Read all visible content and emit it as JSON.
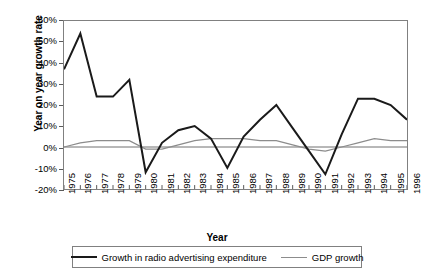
{
  "chart_data": {
    "type": "line",
    "title": "",
    "xlabel": "Year",
    "ylabel": "Year on year growth rate",
    "x": [
      1975,
      1976,
      1977,
      1978,
      1979,
      1980,
      1981,
      1982,
      1983,
      1984,
      1985,
      1986,
      1987,
      1988,
      1989,
      1990,
      1991,
      1992,
      1993,
      1994,
      1995,
      1996
    ],
    "categories": [
      "1975",
      "1976",
      "1977",
      "1978",
      "1979",
      "1980",
      "1981",
      "1982",
      "1983",
      "1984",
      "1985",
      "1986",
      "1987",
      "1988",
      "1989",
      "1990",
      "1991",
      "1992",
      "1993",
      "1994",
      "1995",
      "1996"
    ],
    "xlim": [
      1975,
      1996
    ],
    "ylim": [
      -20,
      60
    ],
    "ytick_values": [
      60,
      50,
      40,
      30,
      20,
      10,
      0,
      -10,
      -20
    ],
    "ytick_labels": [
      "60%",
      "50%",
      "40%",
      "30%",
      "20%",
      "10%",
      "0%",
      "-10%",
      "-20%"
    ],
    "grid": false,
    "legend_position": "bottom",
    "series": [
      {
        "name": "Growth in radio advertising expenditure",
        "color": "#1a1a1a",
        "width": 2,
        "values": [
          37,
          54,
          24,
          24,
          32,
          -12,
          2,
          8,
          10,
          4,
          -10,
          5,
          13,
          20,
          9,
          -2,
          -13,
          6,
          23,
          23,
          20,
          13
        ]
      },
      {
        "name": "GDP growth",
        "color": "#8c8c8c",
        "width": 1.2,
        "values": [
          0,
          2,
          3,
          3,
          3,
          -1,
          -1,
          1,
          3,
          4,
          4,
          4,
          3,
          3,
          1,
          -1,
          -2,
          0,
          2,
          4,
          3,
          3
        ]
      }
    ]
  },
  "legend": {
    "entries": [
      {
        "label": "Growth in radio advertising expenditure"
      },
      {
        "label": "GDP growth"
      }
    ]
  }
}
